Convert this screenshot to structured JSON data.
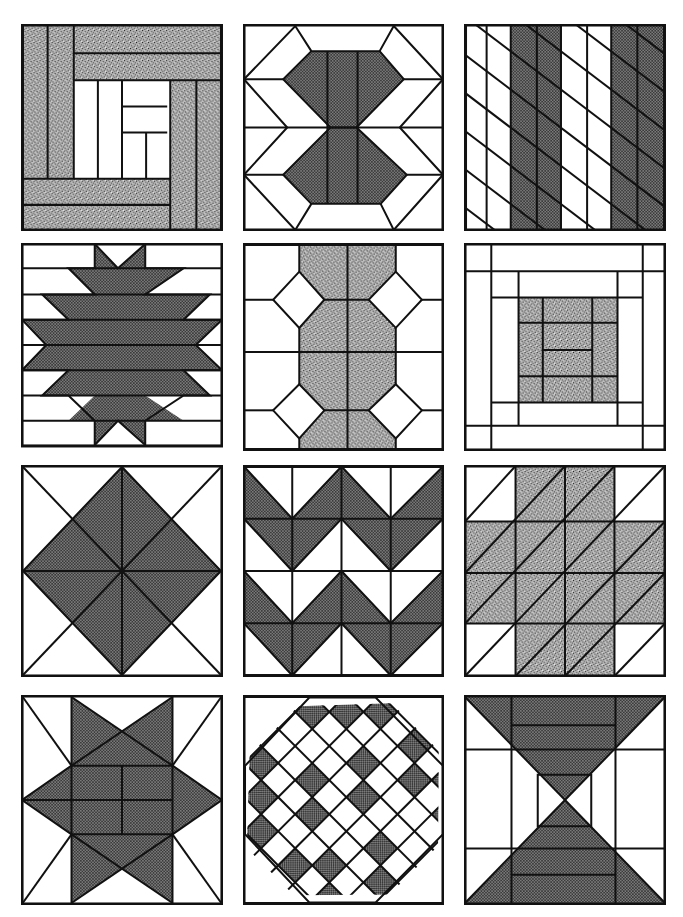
{
  "colors": {
    "ink": "#111111",
    "paper": "#ffffff",
    "dark_fill": "#6e6e6e",
    "stipple_fill": "#9a9a9a"
  },
  "grid": {
    "rows": 4,
    "columns": 3
  },
  "blocks": [
    {
      "id": "log-cabin-stippled",
      "label": "Log cabin (stippled border logs)",
      "fill": "stipple"
    },
    {
      "id": "hexagon-hourglass",
      "label": "Double hexagon with chevron sides",
      "fill": "dark"
    },
    {
      "id": "diagonal-stripes",
      "label": "Bars with diagonal stripes",
      "fill": "dark"
    },
    {
      "id": "navajo-star",
      "label": "Stepped star on horizontal strips",
      "fill": "dark"
    },
    {
      "id": "octagon-chain",
      "label": "Octagon chain with diamonds",
      "fill": "stipple"
    },
    {
      "id": "log-cabin-centre",
      "label": "Log cabin with stippled centre",
      "fill": "stipple"
    },
    {
      "id": "diamond-in-square",
      "label": "Eight-point diamond in square",
      "fill": "dark"
    },
    {
      "id": "flying-geese-zigzag",
      "label": "Zigzag chevrons",
      "fill": "dark"
    },
    {
      "id": "cross-of-triangles",
      "label": "Cross of half-square triangles",
      "fill": "stipple"
    },
    {
      "id": "sawtooth-star",
      "label": "Star with four-patch centre",
      "fill": "dark"
    },
    {
      "id": "checkered-diamond",
      "label": "Checkered on-point diamond",
      "fill": "dark"
    },
    {
      "id": "hourglass-frame",
      "label": "Hourglass with framed centre",
      "fill": "dark"
    }
  ]
}
